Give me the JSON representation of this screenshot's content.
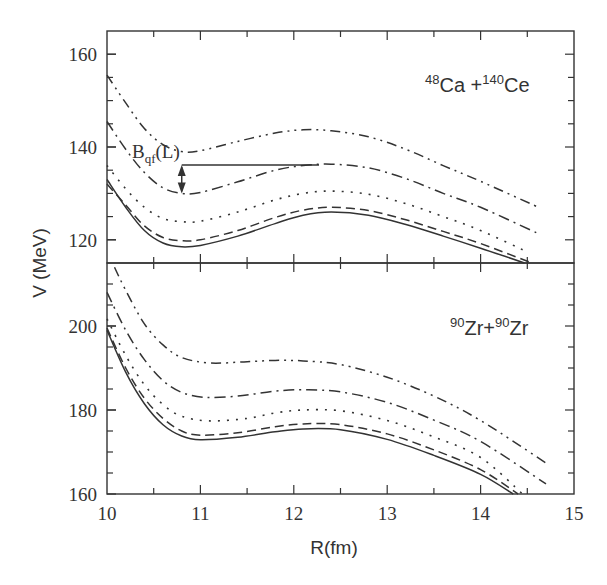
{
  "chart_data": {
    "type": "line",
    "xlabel": "R(fm)",
    "ylabel": "V (MeV)",
    "xlim": [
      10,
      15
    ],
    "x_ticks": [
      10,
      11,
      12,
      13,
      14,
      15
    ],
    "x_tick_labels": [
      "10",
      "11",
      "12",
      "13",
      "14",
      "15"
    ],
    "grid": false,
    "legend": "none",
    "panels": [
      {
        "id": "top",
        "label_mass1": "48",
        "label_el1": "Ca",
        "label_sep": " +",
        "label_mass2": "140",
        "label_el2": "Ce",
        "ylim": [
          115,
          165
        ],
        "y_ticks": [
          160,
          140,
          120
        ],
        "y_tick_labels": [
          "160",
          "140",
          "120"
        ],
        "y_minor_step": 5,
        "annotation": {
          "text_main": "B",
          "text_sub": "qf",
          "text_tail": "(L)",
          "arrow_R": 10.8,
          "arrow_from_V": 136.1,
          "arrow_to_V": 130.0,
          "line_to_R": 12.27
        },
        "series": [
          {
            "name": "solid",
            "style": "solid",
            "points": [
              [
                10.0,
                133
              ],
              [
                10.2,
                127
              ],
              [
                10.4,
                122
              ],
              [
                10.6,
                119.3
              ],
              [
                10.8,
                118.5
              ],
              [
                11.0,
                118.8
              ],
              [
                11.4,
                120.8
              ],
              [
                11.8,
                123.5
              ],
              [
                12.1,
                125.3
              ],
              [
                12.4,
                126
              ],
              [
                12.8,
                125.3
              ],
              [
                13.2,
                123.3
              ],
              [
                13.6,
                120.8
              ],
              [
                14.0,
                118.2
              ],
              [
                14.47,
                115
              ]
            ]
          },
          {
            "name": "dashed",
            "style": "dashed",
            "points": [
              [
                10.0,
                132
              ],
              [
                10.2,
                127.5
              ],
              [
                10.4,
                123
              ],
              [
                10.6,
                120.5
              ],
              [
                10.8,
                119.8
              ],
              [
                11.0,
                120
              ],
              [
                11.4,
                122
              ],
              [
                11.8,
                124.8
              ],
              [
                12.1,
                126.4
              ],
              [
                12.4,
                127
              ],
              [
                12.8,
                126.3
              ],
              [
                13.2,
                124.3
              ],
              [
                13.6,
                121.8
              ],
              [
                14.0,
                119.2
              ],
              [
                14.55,
                115
              ]
            ]
          },
          {
            "name": "dotted",
            "style": "dotted",
            "points": [
              [
                10.0,
                136
              ],
              [
                10.2,
                131
              ],
              [
                10.4,
                127
              ],
              [
                10.6,
                124.6
              ],
              [
                10.8,
                123.9
              ],
              [
                11.0,
                124
              ],
              [
                11.4,
                126
              ],
              [
                11.8,
                128.6
              ],
              [
                12.1,
                130
              ],
              [
                12.4,
                130.5
              ],
              [
                12.8,
                129.8
              ],
              [
                13.2,
                127.8
              ],
              [
                13.6,
                125
              ],
              [
                14.0,
                122
              ],
              [
                14.5,
                117.4
              ]
            ]
          },
          {
            "name": "dash-dot",
            "style": "dashdot",
            "points": [
              [
                10.0,
                145.5
              ],
              [
                10.2,
                139.5
              ],
              [
                10.4,
                134.5
              ],
              [
                10.6,
                131.2
              ],
              [
                10.8,
                130
              ],
              [
                11.0,
                130.2
              ],
              [
                11.4,
                132.5
              ],
              [
                11.8,
                135
              ],
              [
                12.1,
                136
              ],
              [
                12.4,
                136.3
              ],
              [
                12.8,
                135.5
              ],
              [
                13.2,
                133.2
              ],
              [
                13.6,
                130
              ],
              [
                14.0,
                127
              ],
              [
                14.6,
                121.5
              ]
            ]
          },
          {
            "name": "dash-dot-dot",
            "style": "dashdotdot",
            "points": [
              [
                10.0,
                155.5
              ],
              [
                10.2,
                149.5
              ],
              [
                10.4,
                144
              ],
              [
                10.6,
                140.5
              ],
              [
                10.8,
                139
              ],
              [
                11.0,
                139.2
              ],
              [
                11.4,
                141.2
              ],
              [
                11.8,
                143
              ],
              [
                12.1,
                143.7
              ],
              [
                12.4,
                143.5
              ],
              [
                12.8,
                142.2
              ],
              [
                13.2,
                139.5
              ],
              [
                13.6,
                136
              ],
              [
                14.0,
                132.6
              ],
              [
                14.62,
                127
              ]
            ]
          }
        ]
      },
      {
        "id": "bottom",
        "label_mass1": "90",
        "label_el1": "Zr",
        "label_sep": "+",
        "label_mass2": "90",
        "label_el2": "Zr",
        "ylim": [
          160,
          215
        ],
        "y_ticks": [
          200,
          180,
          160
        ],
        "y_tick_labels": [
          "200",
          "180",
          "160"
        ],
        "y_minor_step": 5,
        "series": [
          {
            "name": "solid",
            "style": "solid",
            "points": [
              [
                10.0,
                199
              ],
              [
                10.2,
                189
              ],
              [
                10.4,
                181.5
              ],
              [
                10.6,
                176.5
              ],
              [
                10.8,
                173.8
              ],
              [
                11.0,
                172.9
              ],
              [
                11.4,
                173.5
              ],
              [
                11.8,
                174.8
              ],
              [
                12.1,
                175.5
              ],
              [
                12.5,
                175.3
              ],
              [
                13.0,
                173
              ],
              [
                13.5,
                169.2
              ],
              [
                14.0,
                164.7
              ],
              [
                14.35,
                160
              ]
            ]
          },
          {
            "name": "dashed",
            "style": "dashed",
            "points": [
              [
                10.0,
                199.5
              ],
              [
                10.2,
                190
              ],
              [
                10.4,
                182.8
              ],
              [
                10.6,
                178
              ],
              [
                10.8,
                175
              ],
              [
                11.0,
                174
              ],
              [
                11.4,
                174.6
              ],
              [
                11.8,
                176
              ],
              [
                12.1,
                176.7
              ],
              [
                12.5,
                176.5
              ],
              [
                13.0,
                174.3
              ],
              [
                13.5,
                170.5
              ],
              [
                14.0,
                165.8
              ],
              [
                14.4,
                160
              ]
            ]
          },
          {
            "name": "dotted",
            "style": "dotted",
            "points": [
              [
                10.0,
                201.7
              ],
              [
                10.2,
                193
              ],
              [
                10.4,
                186
              ],
              [
                10.6,
                181.3
              ],
              [
                10.8,
                178.5
              ],
              [
                11.1,
                177.4
              ],
              [
                11.5,
                178
              ],
              [
                11.8,
                179.3
              ],
              [
                12.1,
                180
              ],
              [
                12.5,
                179.8
              ],
              [
                13.0,
                177.5
              ],
              [
                13.5,
                173.6
              ],
              [
                14.0,
                168.7
              ],
              [
                14.45,
                160
              ]
            ]
          },
          {
            "name": "dash-dot",
            "style": "dashdot",
            "points": [
              [
                10.0,
                208
              ],
              [
                10.2,
                199
              ],
              [
                10.4,
                192
              ],
              [
                10.6,
                187
              ],
              [
                10.8,
                184.2
              ],
              [
                11.05,
                183
              ],
              [
                11.4,
                183.3
              ],
              [
                11.8,
                184.5
              ],
              [
                12.1,
                184.8
              ],
              [
                12.5,
                184.3
              ],
              [
                13.0,
                181.8
              ],
              [
                13.5,
                177.6
              ],
              [
                14.0,
                172.5
              ],
              [
                14.7,
                162.4
              ]
            ]
          },
          {
            "name": "dash-dot-dot",
            "style": "dashdotdot",
            "points": [
              [
                10.08,
                214
              ],
              [
                10.2,
                208.5
              ],
              [
                10.4,
                200.5
              ],
              [
                10.6,
                195.5
              ],
              [
                10.8,
                192.5
              ],
              [
                11.1,
                191.2
              ],
              [
                11.5,
                191.5
              ],
              [
                11.8,
                191.8
              ],
              [
                12.1,
                191.7
              ],
              [
                12.5,
                190.8
              ],
              [
                13.0,
                187.8
              ],
              [
                13.5,
                183.3
              ],
              [
                14.0,
                177.5
              ],
              [
                14.72,
                167.1
              ]
            ]
          }
        ]
      }
    ]
  }
}
